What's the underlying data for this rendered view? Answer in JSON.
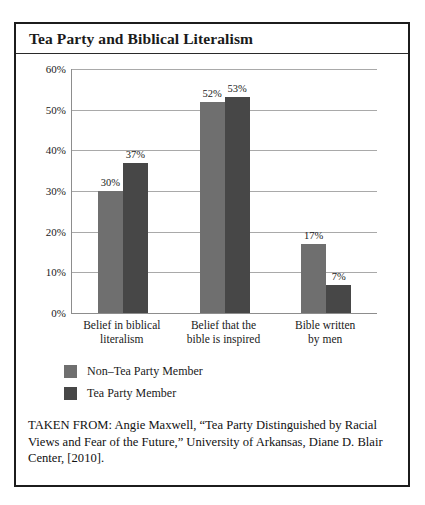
{
  "figure": {
    "title": "Tea Party and Biblical Literalism",
    "source_caption": "TAKEN FROM: Angie Maxwell, “Tea Party Distinguished by Racial Views and Fear of the Future,” University of Arkansas, Diane D. Blair Center, [2010]."
  },
  "colors": {
    "series_non_tea_party": "#6f6f6f",
    "series_tea_party": "#474747",
    "frame_border": "#1c1c1c",
    "gridline": "#a9a9a9",
    "axis_line": "#8d8d8d",
    "text": "#1a1a1a",
    "background": "#ffffff"
  },
  "chart_data": {
    "type": "bar",
    "title": "Tea Party and Biblical Literalism",
    "xlabel": "",
    "ylabel": "",
    "ylim": [
      0,
      60
    ],
    "ytick_labels": [
      "60%",
      "50%",
      "40%",
      "30%",
      "20%",
      "10%",
      "0%"
    ],
    "ytick_values": [
      60,
      50,
      40,
      30,
      20,
      10,
      0
    ],
    "grid": true,
    "legend_position": "below-axis-left",
    "categories": [
      "Belief in biblical literalism",
      "Belief that the bible is inspired",
      "Bible written by men"
    ],
    "category_lines": [
      [
        "Belief in biblical",
        "literalism"
      ],
      [
        "Belief that the",
        "bible is inspired"
      ],
      [
        "Bible written",
        "by men"
      ]
    ],
    "series": [
      {
        "name": "Non–Tea Party Member",
        "color": "#6f6f6f",
        "values": [
          30,
          52,
          17
        ],
        "labels": [
          "30%",
          "52%",
          "17%"
        ]
      },
      {
        "name": "Tea Party Member",
        "color": "#474747",
        "values": [
          37,
          53,
          7
        ],
        "labels": [
          "37%",
          "53%",
          "7%"
        ]
      }
    ]
  }
}
